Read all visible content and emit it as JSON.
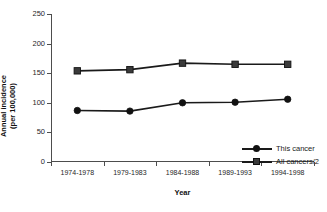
{
  "figure": {
    "title_remnant": "chart title (clipped)"
  },
  "chart_data": {
    "type": "line",
    "title": "",
    "xlabel": "Year",
    "ylabel": "Annual incidence (per 100,000)",
    "ylabel_line1": "Annual incidence",
    "ylabel_line2": "(per 100,000)",
    "categories": [
      "1974-1978",
      "1979-1983",
      "1984-1988",
      "1989-1993",
      "1994-1998"
    ],
    "ylim": [
      0,
      250
    ],
    "yticks": [
      0,
      50,
      100,
      150,
      200,
      250
    ],
    "grid": false,
    "legend_position": "inside lower-right",
    "series": [
      {
        "name": "This cancer",
        "marker": "circle",
        "color": "#111111",
        "values": [
          87,
          86,
          100,
          101,
          106
        ]
      },
      {
        "name": "All cancers/2",
        "marker": "square",
        "color": "#3a3a3a",
        "values": [
          154,
          156,
          167,
          165,
          165
        ]
      }
    ]
  }
}
